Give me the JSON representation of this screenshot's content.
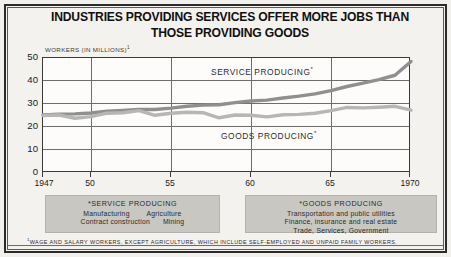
{
  "chart_data": {
    "type": "line",
    "title": "INDUSTRIES PROVIDING SERVICES OFFER MORE JOBS THAN\nTHOSE PROVIDING GOODS",
    "ylabel": "WORKERS (IN MILLIONS)",
    "ylabel_footnote_marker": "1",
    "xlabel": "",
    "ylim": [
      0,
      50
    ],
    "xlim": [
      1947,
      1970
    ],
    "yticks": [
      0,
      10,
      20,
      30,
      40,
      50
    ],
    "xticks": [
      1947,
      1950,
      1955,
      1960,
      1965,
      1970
    ],
    "xticklabels": [
      "1947",
      "50",
      "55",
      "60",
      "65",
      "1970"
    ],
    "grid": "horizontal-and-vertical-at-ticks",
    "legend_position": "inline-annotations",
    "series": [
      {
        "name": "SERVICE PRODUCING",
        "footnote_marker": "*",
        "color": "#8f8f8f",
        "x": [
          1947,
          1948,
          1949,
          1950,
          1951,
          1952,
          1953,
          1954,
          1955,
          1956,
          1957,
          1958,
          1959,
          1960,
          1961,
          1962,
          1963,
          1964,
          1965,
          1966,
          1967,
          1968,
          1969,
          1970
        ],
        "values": [
          25.2,
          25.6,
          25.7,
          26.1,
          26.9,
          27.2,
          27.6,
          27.6,
          28.2,
          29.0,
          29.5,
          29.7,
          30.6,
          31.3,
          31.7,
          32.6,
          33.4,
          34.4,
          35.8,
          37.6,
          39.1,
          40.6,
          42.5,
          48.5
        ],
        "label_point": {
          "x": 1962,
          "y": 42
        }
      },
      {
        "name": "GOODS PRODUCING",
        "footnote_marker": "*",
        "color": "#b6b6b6",
        "x": [
          1947,
          1948,
          1949,
          1950,
          1951,
          1952,
          1953,
          1954,
          1955,
          1956,
          1957,
          1958,
          1959,
          1960,
          1961,
          1962,
          1963,
          1964,
          1965,
          1966,
          1967,
          1968,
          1969,
          1970
        ],
        "values": [
          25.0,
          25.2,
          23.8,
          24.5,
          26.0,
          26.2,
          27.1,
          25.1,
          26.0,
          26.4,
          26.2,
          24.0,
          25.2,
          25.1,
          24.4,
          25.3,
          25.5,
          26.0,
          27.1,
          28.5,
          28.3,
          28.6,
          29.0,
          27.3
        ],
        "label_point": {
          "x": 1961,
          "y": 22
        }
      }
    ],
    "crossover_note": "Series cross near 1957 at about 27 million"
  },
  "legends": {
    "left": {
      "heading": "*SERVICE PRODUCING",
      "lines": [
        "Manufacturing        Agriculture",
        "Contract construction      Mining"
      ]
    },
    "right": {
      "heading": "*GOODS PRODUCING",
      "lines": [
        "Transportation and public utilities",
        "Finance, insurance and real estate",
        "Trade, Services, Government"
      ]
    }
  },
  "footnote": {
    "marker": "1",
    "text": "WAGE AND SALARY WORKERS, EXCEPT AGRICULTURE, WHICH INCLUDE SELF-EMPLOYED AND UNPAID FAMILY WORKERS."
  }
}
